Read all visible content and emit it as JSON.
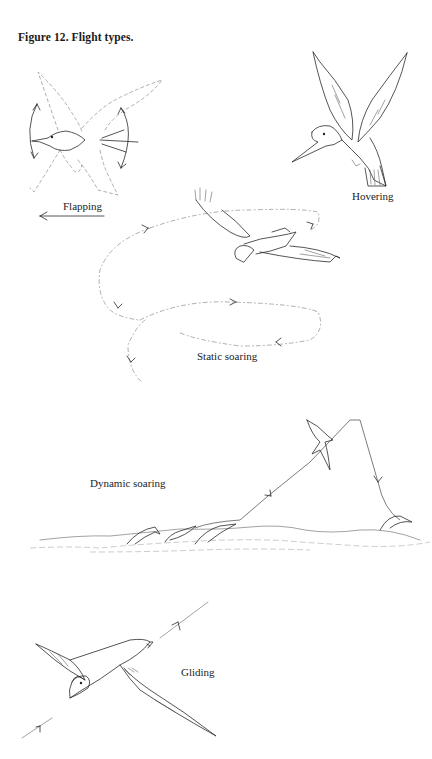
{
  "figure": {
    "title": "Figure 12. Flight types."
  },
  "panels": [
    {
      "id": "flapping",
      "label": "Flapping"
    },
    {
      "id": "hovering",
      "label": "Hovering"
    },
    {
      "id": "static_soaring",
      "label": "Static soaring"
    },
    {
      "id": "dynamic_soaring",
      "label": "Dynamic soaring"
    },
    {
      "id": "gliding",
      "label": "Gliding"
    }
  ],
  "colors": {
    "ink": "#2a2a2a",
    "dashed_path": "#999999",
    "background": "#ffffff"
  }
}
